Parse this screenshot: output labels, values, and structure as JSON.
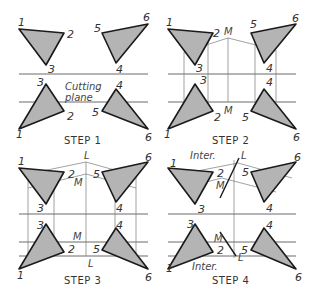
{
  "figure": {
    "panels": [
      {
        "id": "step1",
        "title": "STEP 1",
        "annotation": [
          "Cutting",
          "plane"
        ],
        "vertex_labels": [
          "1",
          "2",
          "3",
          "5",
          "6",
          "4",
          "3",
          "2",
          "1",
          "4",
          "5",
          "6"
        ]
      },
      {
        "id": "step2",
        "title": "STEP 2",
        "point_labels": [
          "M",
          "M"
        ],
        "vertex_labels": [
          "1",
          "2",
          "3",
          "5",
          "6",
          "4",
          "3",
          "2",
          "1",
          "4",
          "5",
          "6"
        ]
      },
      {
        "id": "step3",
        "title": "STEP 3",
        "point_labels": [
          "L",
          "M",
          "M",
          "L"
        ],
        "vertex_labels": [
          "1",
          "2",
          "3",
          "5",
          "6",
          "4",
          "3",
          "2",
          "1",
          "4",
          "5",
          "6"
        ]
      },
      {
        "id": "step4",
        "title": "STEP 4",
        "point_labels": [
          "Inter.",
          "L",
          "M",
          "M",
          "L",
          "Inter."
        ],
        "vertex_labels": [
          "1",
          "2",
          "3",
          "5",
          "6",
          "4",
          "3",
          "2",
          "1",
          "4",
          "5",
          "6"
        ]
      }
    ],
    "colors": {
      "triangle_fill": "#b4b4b4",
      "outline": "#1a1a1a",
      "construction_line": "#7a7a7a"
    }
  }
}
